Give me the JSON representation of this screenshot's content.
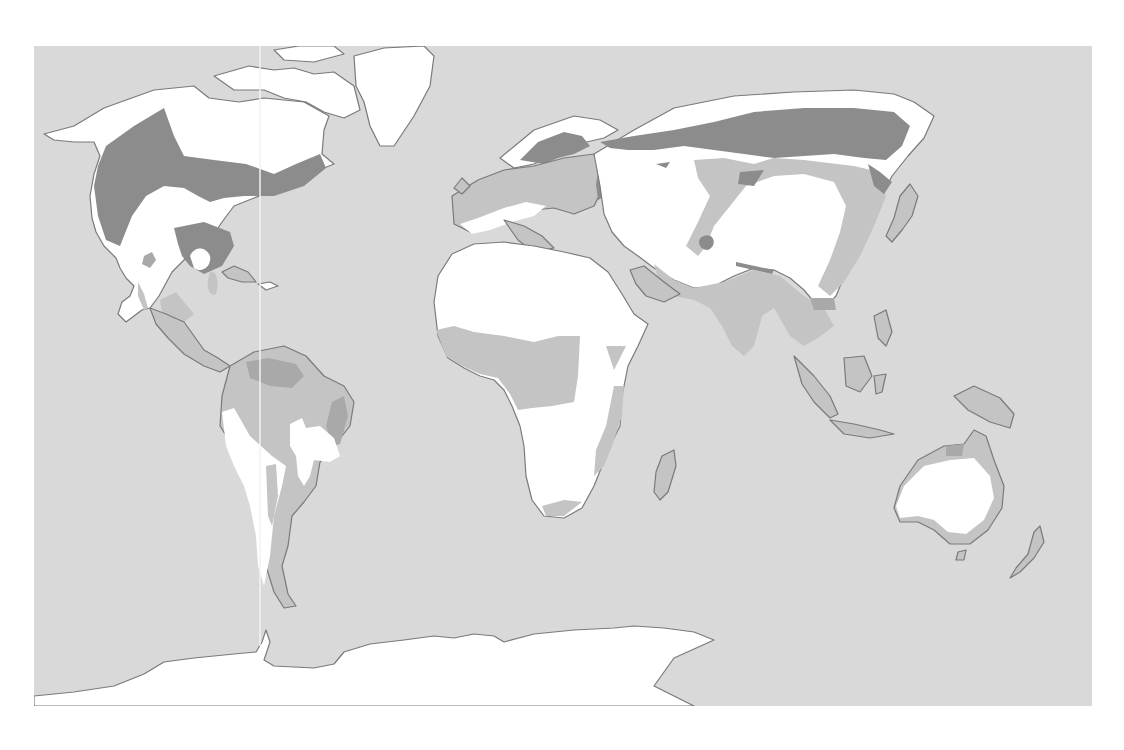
{
  "map": {
    "type": "world-thematic-zone-map",
    "projection": "equirectangular-like",
    "frame": {
      "x": 34,
      "y": 46,
      "width": 1058,
      "height": 660
    },
    "colors": {
      "background": "#ffffff",
      "ocean": "#d9d9d9",
      "zone_white": "#ffffff",
      "zone_light_gray": "#c4c4c4",
      "zone_mid_gray": "#a9a9a9",
      "zone_dark_gray": "#8c8c8c",
      "coastline": "#7a7a7a"
    },
    "zones": [
      {
        "id": "white",
        "label": ""
      },
      {
        "id": "light-gray",
        "label": ""
      },
      {
        "id": "mid-gray",
        "label": ""
      },
      {
        "id": "dark-gray",
        "label": ""
      }
    ],
    "regions": [
      "north-america",
      "greenland",
      "central-america",
      "caribbean",
      "south-america",
      "europe",
      "africa",
      "madagascar",
      "middle-east",
      "asia",
      "japan",
      "southeast-asia",
      "indonesia",
      "new-guinea",
      "australia",
      "new-zealand",
      "antarctica"
    ]
  }
}
